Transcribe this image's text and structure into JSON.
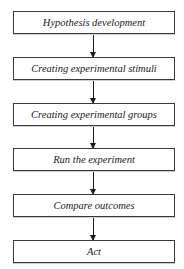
{
  "diagram": {
    "type": "flowchart",
    "direction": "top-to-bottom",
    "steps": [
      {
        "label": "Hypothesis development"
      },
      {
        "label": "Creating experimental stimuli"
      },
      {
        "label": "Creating experimental groups"
      },
      {
        "label": "Run the experiment"
      },
      {
        "label": "Compare outcomes"
      },
      {
        "label": "Act"
      }
    ],
    "edges": [
      {
        "from": 0,
        "to": 1
      },
      {
        "from": 1,
        "to": 2
      },
      {
        "from": 2,
        "to": 3
      },
      {
        "from": 3,
        "to": 4
      },
      {
        "from": 4,
        "to": 5
      }
    ]
  }
}
